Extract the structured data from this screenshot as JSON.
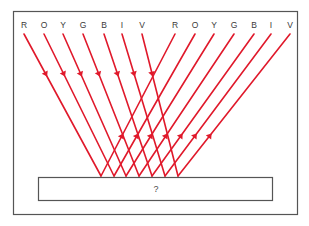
{
  "figure": {
    "name": "light-ray-reflection-diagram",
    "outer_border_color": "#555555",
    "ray_color": "#E0192B",
    "label_color": "#3a3a3a",
    "background_color": "#ffffff"
  },
  "incoming_labels": [
    {
      "letter": "R",
      "x": 24
    },
    {
      "letter": "O",
      "x": 44
    },
    {
      "letter": "Y",
      "x": 63
    },
    {
      "letter": "G",
      "x": 83
    },
    {
      "letter": "B",
      "x": 104
    },
    {
      "letter": "I",
      "x": 122
    },
    {
      "letter": "V",
      "x": 142
    }
  ],
  "outgoing_labels": [
    {
      "letter": "R",
      "x": 175
    },
    {
      "letter": "O",
      "x": 195
    },
    {
      "letter": "Y",
      "x": 214
    },
    {
      "letter": "G",
      "x": 234
    },
    {
      "letter": "B",
      "x": 254
    },
    {
      "letter": "I",
      "x": 271
    },
    {
      "letter": "V",
      "x": 290
    }
  ],
  "incoming_rays": [
    {
      "x1": 24,
      "y1": 34,
      "x2": 101,
      "y2": 176
    },
    {
      "x1": 44,
      "y1": 34,
      "x2": 114,
      "y2": 176
    },
    {
      "x1": 63,
      "y1": 34,
      "x2": 126,
      "y2": 176
    },
    {
      "x1": 83,
      "y1": 34,
      "x2": 139,
      "y2": 176
    },
    {
      "x1": 104,
      "y1": 34,
      "x2": 152,
      "y2": 176
    },
    {
      "x1": 122,
      "y1": 34,
      "x2": 165,
      "y2": 176
    },
    {
      "x1": 142,
      "y1": 34,
      "x2": 178,
      "y2": 176
    }
  ],
  "outgoing_rays": [
    {
      "x1": 101,
      "y1": 176,
      "x2": 175,
      "y2": 34
    },
    {
      "x1": 114,
      "y1": 176,
      "x2": 195,
      "y2": 34
    },
    {
      "x1": 126,
      "y1": 176,
      "x2": 214,
      "y2": 34
    },
    {
      "x1": 139,
      "y1": 176,
      "x2": 234,
      "y2": 34
    },
    {
      "x1": 152,
      "y1": 176,
      "x2": 254,
      "y2": 34
    },
    {
      "x1": 165,
      "y1": 176,
      "x2": 271,
      "y2": 34
    },
    {
      "x1": 178,
      "y1": 176,
      "x2": 290,
      "y2": 34
    }
  ],
  "surface_box": {
    "label": "?",
    "x": 38,
    "y": 177,
    "width": 234,
    "height": 23,
    "border_color": "#555555"
  },
  "outer_frame": {
    "x": 13,
    "y": 11,
    "width": 284,
    "height": 203
  }
}
